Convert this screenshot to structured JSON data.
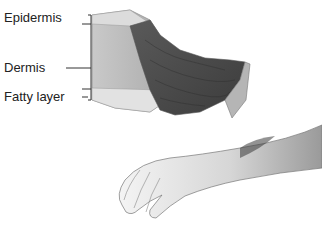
{
  "diagram": {
    "labels": [
      {
        "text": "Epidermis"
      },
      {
        "text": "Dermis"
      },
      {
        "text": "Fatty layer"
      }
    ]
  }
}
